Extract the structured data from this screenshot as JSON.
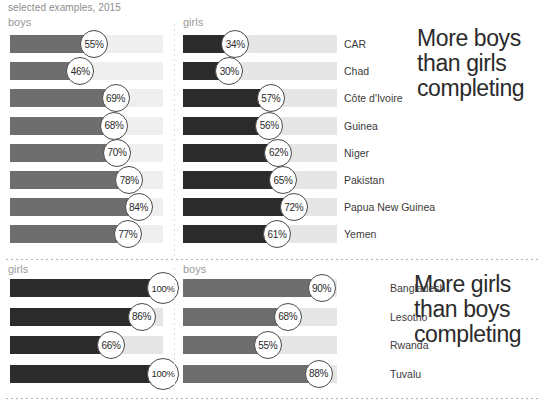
{
  "caption": "selected examples, 2015",
  "colors": {
    "boys_bar": "#6e6e6e",
    "girls_bar": "#2b2b2b",
    "track": "#e6e6e6",
    "text": "#3b3b3b",
    "muted": "#9a9a9a"
  },
  "sections": [
    {
      "id": "more-boys",
      "headline": "More boys\nthan girls\ncompleting",
      "left_column_label": "boys",
      "right_column_label": "girls",
      "left_series": "boys",
      "right_series": "girls",
      "rows": [
        {
          "country": "CAR",
          "left": 55,
          "right": 34,
          "left_label": "55%",
          "right_label": "34%"
        },
        {
          "country": "Chad",
          "left": 46,
          "right": 30,
          "left_label": "46%",
          "right_label": "30%"
        },
        {
          "country": "Côte d'Ivoire",
          "left": 69,
          "right": 57,
          "left_label": "69%",
          "right_label": "57%"
        },
        {
          "country": "Guinea",
          "left": 68,
          "right": 56,
          "left_label": "68%",
          "right_label": "56%"
        },
        {
          "country": "Niger",
          "left": 70,
          "right": 62,
          "left_label": "70%",
          "right_label": "62%"
        },
        {
          "country": "Pakistan",
          "left": 78,
          "right": 65,
          "left_label": "78%",
          "right_label": "65%"
        },
        {
          "country": "Papua New Guinea",
          "left": 84,
          "right": 72,
          "left_label": "84%",
          "right_label": "72%"
        },
        {
          "country": "Yemen",
          "left": 77,
          "right": 61,
          "left_label": "77%",
          "right_label": "61%"
        }
      ]
    },
    {
      "id": "more-girls",
      "headline": "More girls\nthan boys\ncompleting",
      "left_column_label": "girls",
      "right_column_label": "boys",
      "left_series": "girls",
      "right_series": "boys",
      "rows": [
        {
          "country": "Bangladesh",
          "left": 100,
          "right": 90,
          "left_label": "100%",
          "right_label": "90%"
        },
        {
          "country": "Lesotho",
          "left": 86,
          "right": 68,
          "left_label": "86%",
          "right_label": "68%"
        },
        {
          "country": "Rwanda",
          "left": 66,
          "right": 55,
          "left_label": "66%",
          "right_label": "55%"
        },
        {
          "country": "Tuvalu",
          "left": 100,
          "right": 88,
          "left_label": "100%",
          "right_label": "88%"
        }
      ]
    }
  ],
  "chart_data": {
    "type": "bar",
    "title": "",
    "subtitle": "selected examples, 2015",
    "xlabel": "",
    "ylabel": "",
    "xlim": [
      0,
      100
    ],
    "grid": false,
    "legend_position": "column-headers",
    "orientation": "horizontal",
    "units": "percent",
    "panels": [
      {
        "name": "More boys than girls completing",
        "categories": [
          "CAR",
          "Chad",
          "Côte d'Ivoire",
          "Guinea",
          "Niger",
          "Pakistan",
          "Papua New Guinea",
          "Yemen"
        ],
        "series": [
          {
            "name": "boys",
            "values": [
              55,
              46,
              69,
              68,
              70,
              78,
              84,
              77
            ]
          },
          {
            "name": "girls",
            "values": [
              34,
              30,
              57,
              56,
              62,
              65,
              72,
              61
            ]
          }
        ]
      },
      {
        "name": "More girls than boys completing",
        "categories": [
          "Bangladesh",
          "Lesotho",
          "Rwanda",
          "Tuvalu"
        ],
        "series": [
          {
            "name": "girls",
            "values": [
              100,
              86,
              66,
              100
            ]
          },
          {
            "name": "boys",
            "values": [
              90,
              68,
              55,
              88
            ]
          }
        ]
      }
    ]
  }
}
